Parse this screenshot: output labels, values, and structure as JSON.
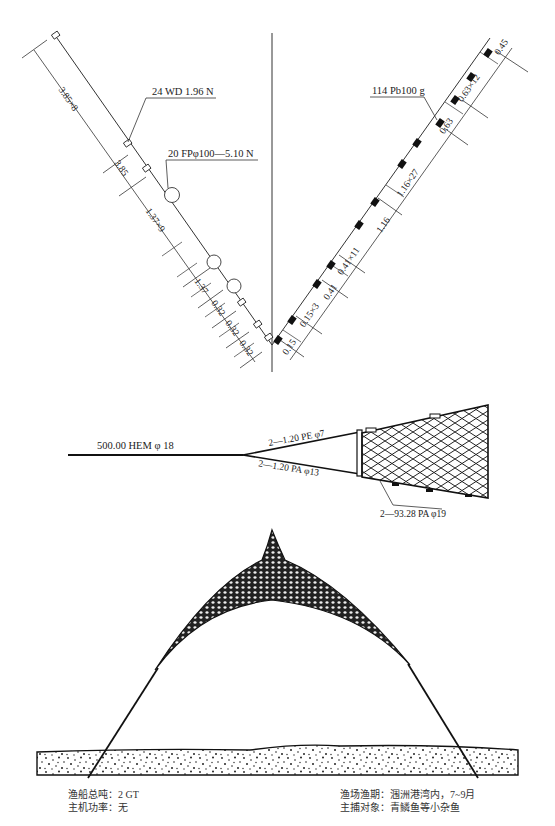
{
  "top_diagram": {
    "left_labels": {
      "sinker_callout": "24 WD 1.96 N",
      "float_callout": "20 FPφ100—5.10 N",
      "dims": [
        "3.85×8",
        "3.85",
        "1.37×9",
        "1.37",
        "0.32",
        "0.32",
        "0.32"
      ]
    },
    "right_labels": {
      "lead_callout": "114 Pb100 g",
      "dims": [
        "0.15",
        "0.15×3",
        "0.41",
        "0.41×11",
        "1.16",
        "1.16×27",
        "0.63",
        "0.63×12",
        "0.45"
      ]
    }
  },
  "middle_diagram": {
    "main_rope": "500.00 HEM φ 18",
    "upper_bridle": "2—1.20 PE φ7",
    "lower_bridle": "2—1.20 PA φ13",
    "footrope": "2—93.28 PA φ19"
  },
  "footer": {
    "left": {
      "line1": "渔船总吨：2 GT",
      "line2": "主机功率：无"
    },
    "right": {
      "line1": "渔场渔期：涠洲港湾内，7~9月",
      "line2": "主捕对象：青鳞鱼等小杂鱼"
    }
  }
}
